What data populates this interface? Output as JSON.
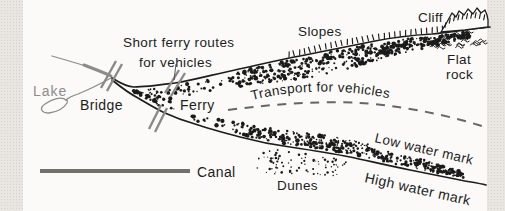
{
  "diagram": {
    "labels": {
      "lake": "Lake",
      "bridge": "Bridge",
      "short_ferry_line1": "Short ferry routes",
      "short_ferry_line2": "for vehicles",
      "ferry": "Ferry",
      "slopes": "Slopes",
      "cliff": "Cliff",
      "flat_rock_line1": "Flat",
      "flat_rock_line2": "rock",
      "transport": "Transport for vehicles",
      "low_water": "Low water mark",
      "high_water": "High water mark",
      "dunes": "Dunes",
      "canal": "Canal"
    },
    "colors": {
      "ink": "#1d1d1d",
      "gray_ink": "#8c8c8c",
      "lake_label": "#8d8d8d",
      "canal_line": "#73716e",
      "dashed_line": "#666666",
      "paper": "#fbfaf8",
      "margin_texture": "#e9e6e2"
    }
  }
}
